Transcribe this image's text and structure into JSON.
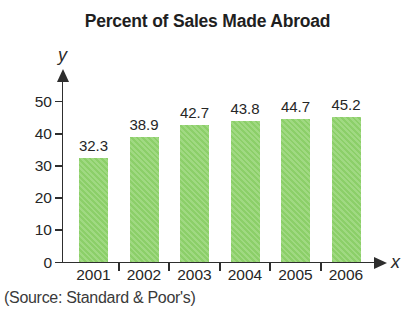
{
  "chart_data": {
    "type": "bar",
    "title": "Percent of Sales Made Abroad",
    "categories": [
      "2001",
      "2002",
      "2003",
      "2004",
      "2005",
      "2006"
    ],
    "values": [
      32.3,
      38.9,
      42.7,
      43.8,
      44.7,
      45.2
    ],
    "xlabel": "x",
    "ylabel": "y",
    "yticks": [
      0,
      10,
      20,
      30,
      40,
      50
    ],
    "ylim": [
      0,
      57
    ],
    "grid": false,
    "legend": "none",
    "bar_color": "#97d57a",
    "source": "(Source: Standard & Poor's)"
  }
}
